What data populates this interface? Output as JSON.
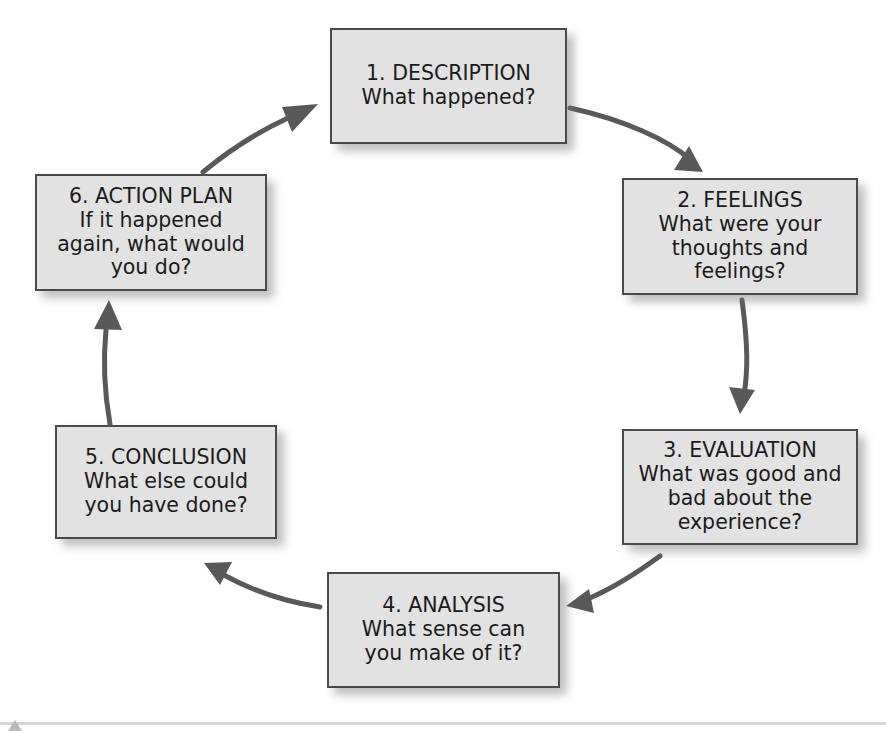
{
  "diagram": {
    "type": "cycle",
    "direction": "clockwise",
    "node_fill": "#e2e2e2",
    "node_border": "#4a4a4a",
    "arrow_color": "#595959",
    "text_color": "#1b1b1b",
    "nodes": [
      {
        "id": "description",
        "title": "1. DESCRIPTION",
        "body": "What happened?"
      },
      {
        "id": "feelings",
        "title": "2. FEELINGS",
        "body": "What were your\nthoughts and\nfeelings?"
      },
      {
        "id": "evaluation",
        "title": "3. EVALUATION",
        "body": "What was good and\nbad about the\nexperience?"
      },
      {
        "id": "analysis",
        "title": "4. ANALYSIS",
        "body": "What sense can\nyou make of it?"
      },
      {
        "id": "conclusion",
        "title": "5. CONCLUSION",
        "body": "What else could\nyou have done?"
      },
      {
        "id": "action-plan",
        "title": "6. ACTION PLAN",
        "body": "If it happened\nagain, what would\nyou do?"
      }
    ],
    "edges": [
      {
        "from": "description",
        "to": "feelings"
      },
      {
        "from": "feelings",
        "to": "evaluation"
      },
      {
        "from": "evaluation",
        "to": "analysis"
      },
      {
        "from": "analysis",
        "to": "conclusion"
      },
      {
        "from": "conclusion",
        "to": "action-plan"
      },
      {
        "from": "action-plan",
        "to": "description"
      }
    ]
  }
}
